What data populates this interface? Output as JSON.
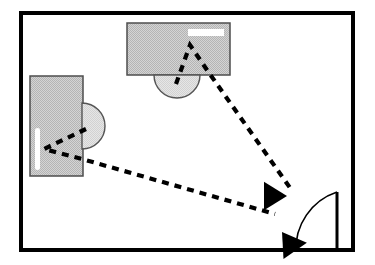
{
  "diagram": {
    "type": "floor-plan",
    "view": "top-down",
    "canvas": {
      "width": 375,
      "height": 265
    },
    "colors": {
      "wall": "#000000",
      "furniture_fill": "#c9c9c9",
      "furniture_stroke": "#4d4d4d",
      "chair_fill": "#e0e0e0",
      "chair_stroke": "#555555",
      "highlight": "#ffffff",
      "sightline": "#000000",
      "arrow": "#000000",
      "door": "#000000"
    }
  },
  "room": {
    "label": "room-outline",
    "x": 21,
    "y": 13,
    "width": 332,
    "height": 237,
    "wall_thickness": 4
  },
  "furniture": [
    {
      "name": "desk-left",
      "label": "Left desk",
      "shape": "rectangle",
      "x": 30,
      "y": 76,
      "width": 53,
      "height": 100,
      "highlight": {
        "x": 35,
        "y": 128,
        "width": 5,
        "height": 42
      }
    },
    {
      "name": "desk-top",
      "label": "Top desk",
      "shape": "rectangle",
      "x": 127,
      "y": 23,
      "width": 103,
      "height": 52,
      "highlight": {
        "x": 188,
        "y": 29,
        "width": 36,
        "height": 7
      }
    }
  ],
  "seats": [
    {
      "name": "chair-left",
      "label": "Left workstation chair",
      "shape": "semicircle",
      "orientation": "right",
      "cx": 82,
      "cy": 126,
      "radius": 23
    },
    {
      "name": "chair-top",
      "label": "Top workstation chair",
      "shape": "semicircle",
      "orientation": "down",
      "cx": 177,
      "cy": 75,
      "radius": 23
    }
  ],
  "door": {
    "name": "door",
    "label": "Door",
    "leaf": {
      "x1": 337,
      "y1": 192,
      "x2": 337,
      "y2": 250
    },
    "arc": {
      "from_x": 337,
      "from_y": 192,
      "to_x": 296,
      "to_y": 252,
      "radius": 60
    },
    "swing": "inward"
  },
  "sightlines": [
    {
      "name": "sightline-top-desk-to-door",
      "label": "Sight line from top workstation to door",
      "style": "dashed",
      "points": [
        [
          176,
          84
        ],
        [
          190,
          45
        ],
        [
          207,
          70
        ],
        [
          293,
          192
        ]
      ]
    },
    {
      "name": "sightline-left-desk-to-door",
      "label": "Sight line from left workstation to door",
      "style": "dashed",
      "points": [
        [
          86,
          129
        ],
        [
          44,
          149
        ],
        [
          82,
          159
        ],
        [
          275,
          214
        ]
      ]
    }
  ],
  "arrows": [
    {
      "name": "arrow-upper-to-door",
      "label": "Arrowhead pointing at door (upper)",
      "tip_x": 287,
      "tip_y": 196,
      "angle_deg": 180,
      "size": 23
    },
    {
      "name": "arrow-lower-to-door",
      "label": "Arrowhead pointing at door (lower)",
      "tip_x": 282,
      "tip_y": 232,
      "angle_deg": 55,
      "size": 23
    }
  ]
}
